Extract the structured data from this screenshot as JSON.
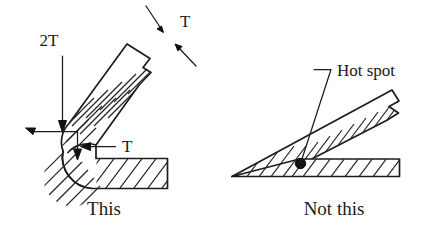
{
  "figure": {
    "type": "engineering-detail-comparison",
    "background_color": "#ffffff",
    "line_color": "#1c1c1c",
    "hatch_color": "#262626",
    "marker_color": "#111111"
  },
  "good_practice": {
    "caption": "This",
    "dimension_labels": {
      "wall_thickness_top": "T",
      "bend_radius": "2T",
      "wall_thickness_bottom": "T"
    }
  },
  "bad_practice": {
    "caption": "Not this",
    "annotation": "Hot spot"
  }
}
